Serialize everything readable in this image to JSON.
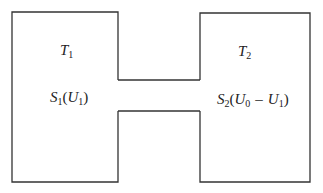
{
  "diagram": {
    "type": "two-chamber-system",
    "stroke_color": "#333333",
    "left_chamber": {
      "temperature": {
        "symbol": "T",
        "subscript": "1"
      },
      "entropy": {
        "symbol": "S",
        "subscript": "1",
        "arg_symbol": "U",
        "arg_subscript": "1"
      }
    },
    "right_chamber": {
      "temperature": {
        "symbol": "T",
        "subscript": "2"
      },
      "entropy": {
        "symbol": "S",
        "subscript": "2",
        "arg_a_symbol": "U",
        "arg_a_subscript": "0",
        "operator": "–",
        "arg_b_symbol": "U",
        "arg_b_subscript": "1"
      }
    },
    "punct": {
      "open": "(",
      "close": ")"
    }
  }
}
